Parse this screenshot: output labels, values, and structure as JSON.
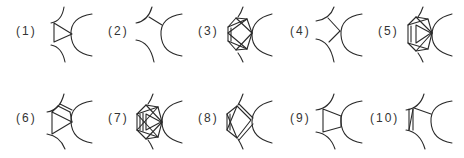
{
  "figure": {
    "stroke_color": "#2a2a2a",
    "label_color": "#333333",
    "panels": [
      {
        "id": 1,
        "label": "(1)",
        "pattern": "triangle"
      },
      {
        "id": 2,
        "label": "(2)",
        "pattern": "single-bond"
      },
      {
        "id": 3,
        "label": "(3)",
        "pattern": "hexagon-with-inner-triangles"
      },
      {
        "id": 4,
        "label": "(4)",
        "pattern": "y-junction"
      },
      {
        "id": 5,
        "label": "(5)",
        "pattern": "hexagon-with-triangle-and-double-edge"
      },
      {
        "id": 6,
        "label": "(6)",
        "pattern": "triangle-with-double-edge"
      },
      {
        "id": 7,
        "label": "(7)",
        "pattern": "dense-hexagon-mesh"
      },
      {
        "id": 8,
        "label": "(8)",
        "pattern": "pentagon-with-double-edges"
      },
      {
        "id": 9,
        "label": "(9)",
        "pattern": "quadrilateral"
      },
      {
        "id": 10,
        "label": "(10)",
        "pattern": "double-left-edge-with-single-bond"
      }
    ]
  }
}
